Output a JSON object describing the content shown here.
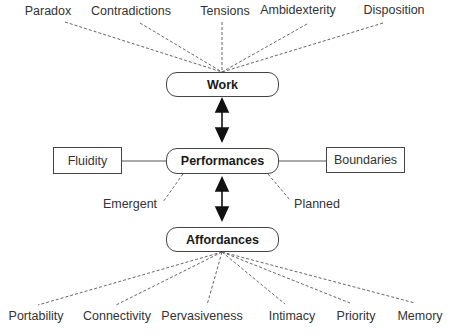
{
  "diagram": {
    "core_nodes": {
      "work": "Work",
      "performances": "Performances",
      "affordances": "Affordances"
    },
    "side_nodes": {
      "left": "Fluidity",
      "right": "Boundaries"
    },
    "performance_modes": {
      "left": "Emergent",
      "right": "Planned"
    },
    "work_attributes": [
      "Paradox",
      "Contradictions",
      "Tensions",
      "Ambidexterity",
      "Disposition"
    ],
    "affordance_attributes": [
      "Portability",
      "Connectivity",
      "Pervasiveness",
      "Intimacy",
      "Priority",
      "Memory"
    ],
    "colors": {
      "line": "#555555",
      "arrow": "#111111",
      "border": "#444444"
    }
  }
}
